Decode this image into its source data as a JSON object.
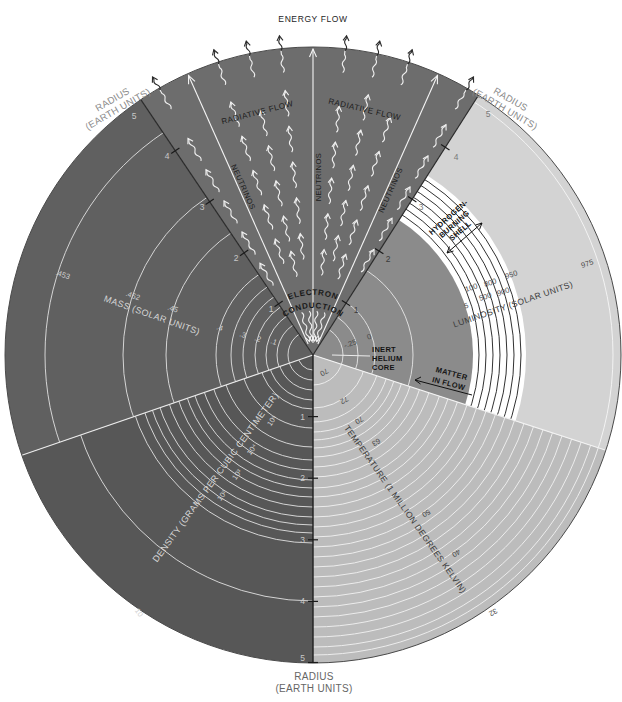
{
  "header": {
    "energy_flow": "ENERGY FLOW"
  },
  "radius_axis": {
    "label_line1": "RADIUS",
    "label_line2": "(EARTH UNITS)",
    "ticks": [
      "1",
      "2",
      "3",
      "4",
      "5"
    ]
  },
  "energy_wedge": {
    "radiative_flow_left": "RADIATIVE FLOW",
    "radiative_flow_right": "RADIATIVE FLOW",
    "neutrinos_left": "NEUTRINOS",
    "neutrinos_center": "NEUTRINOS",
    "neutrinos_right": "NEUTRINOS",
    "conduction_line1": "ELECTRON",
    "conduction_line2": "CONDUCTION"
  },
  "mass_sector": {
    "label": "MASS (SOLAR UNITS)",
    "values": [
      ".453",
      ".452",
      ".45",
      ".4",
      ".3",
      ".2",
      ".1"
    ]
  },
  "luminosity_sector": {
    "label": "LUMINOSITY (SOLAR UNITS)",
    "values": [
      "100",
      "800",
      "950",
      "5",
      "500",
      "900",
      "975"
    ],
    "shell_line1": "HYDROGEN-",
    "shell_line2": "BURNING",
    "shell_line3": "SHELL",
    "core_line1": "INERT",
    "core_line2": "HELIUM",
    "core_line3": "CORE",
    "core_values": [
      "0",
      "-.25"
    ],
    "matter_line1": "MATTER",
    "matter_line2": "IN FLOW"
  },
  "temperature_sector": {
    "label": "TEMPERATURE (1 MILLION DEGREES KELVIN)",
    "values": [
      "70",
      "72",
      "70",
      "63",
      "50",
      "40",
      "32"
    ]
  },
  "density_sector": {
    "label": "DENSITY (GRAMS PER CUBIC CENTIMETER)",
    "values": [
      "10⁵",
      "10⁴",
      "10³",
      "10²",
      "10"
    ]
  },
  "colors": {
    "mass": "#606060",
    "density": "#575757",
    "energy_wedge": "#6d6d6d",
    "luminosity_outer": "#d3d3d3",
    "luminosity_shell": "#ffffff",
    "luminosity_core": "#8b8b8b",
    "temperature": "#bcbcbc"
  }
}
